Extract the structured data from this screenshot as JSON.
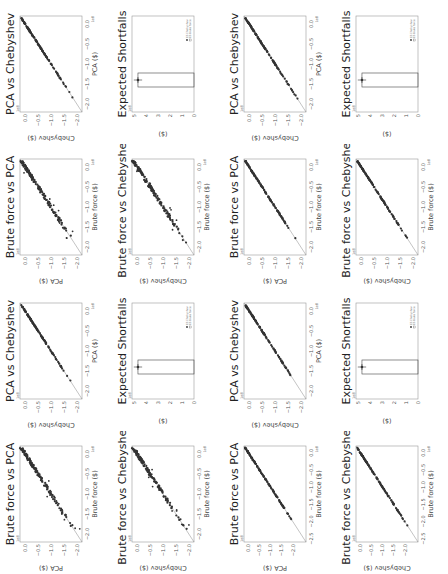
{
  "figure": {
    "orientation": "rotated 90 degrees counter-clockwise",
    "panels": [
      {
        "id": "q1",
        "position": "natural-top-left",
        "scatter_style": "outliers",
        "x_ticks": [
          "-2.0",
          "-1.5",
          "-1.0",
          "-0.5",
          "0.0"
        ]
      },
      {
        "id": "q2",
        "position": "natural-top-right",
        "scatter_style": "outliers",
        "x_ticks": [
          "-2.0",
          "-1.5",
          "-1.0",
          "-0.5",
          "0.0"
        ]
      },
      {
        "id": "q3",
        "position": "natural-bottom-left",
        "scatter_style": "tight",
        "x_ticks": [
          "-2.5",
          "-2.0",
          "-1.5",
          "-1.0",
          "-0.5",
          "0.0"
        ]
      },
      {
        "id": "q4",
        "position": "natural-bottom-right",
        "scatter_style": "tight",
        "x_ticks": [
          "-2.0",
          "-1.5",
          "-1.0",
          "-0.5",
          "0.0"
        ]
      }
    ],
    "subplot_titles": {
      "bf_pca": "Brute force vs PCA",
      "pca_cheb": "PCA vs Chebyshev",
      "bf_cheb": "Brute force vs Chebyshev",
      "es": "Expected Shortfalls"
    },
    "axis_labels": {
      "brute_force": "Brute force ($)",
      "pca": "PCA ($)",
      "chebyshev": "Chebyshev ($)",
      "es_y": "($)"
    },
    "exponent_label": "1e8",
    "legend": {
      "marker_label": "ES Chebyshev",
      "bar_label": "ES Brute force"
    },
    "colors": {
      "points": "#333333",
      "line": "#888888",
      "axes": "#999999"
    }
  },
  "chart_data": [
    {
      "type": "scatter",
      "title": "Brute force vs PCA",
      "xlabel": "Brute force ($)",
      "ylabel": "PCA ($)",
      "xlim": [
        -2.2,
        0.2
      ],
      "ylim": [
        -2.2,
        0.2
      ],
      "scale": "1e8",
      "description": "points along y=x with several outliers"
    },
    {
      "type": "scatter",
      "title": "PCA vs Chebyshev",
      "xlabel": "PCA ($)",
      "ylabel": "Chebyshev ($)",
      "xlim": [
        -2.2,
        0.2
      ],
      "ylim": [
        -2.2,
        0.2
      ],
      "scale": "1e8",
      "description": "points tightly along y=x"
    },
    {
      "type": "scatter",
      "title": "Brute force vs Chebyshev",
      "xlabel": "Brute force ($)",
      "ylabel": "Chebyshev ($)",
      "xlim": [
        -2.2,
        0.2
      ],
      "ylim": [
        -2.2,
        0.2
      ],
      "scale": "1e8",
      "description": "points along y=x with outliers (tight in lower panels)"
    },
    {
      "type": "bar",
      "title": "Expected Shortfalls",
      "ylabel": "($)",
      "ylim": [
        0,
        5
      ],
      "yticks": [
        0,
        1,
        2,
        3,
        4,
        5
      ],
      "scale": "1e8",
      "series": [
        {
          "name": "ES Brute force",
          "values": [
            4.7
          ]
        },
        {
          "name": "ES Chebyshev",
          "values": [
            4.7
          ],
          "error": 0.3
        }
      ]
    }
  ]
}
